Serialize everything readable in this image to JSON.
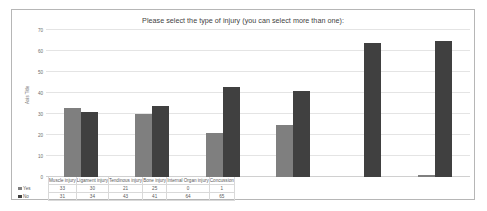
{
  "chart_data": {
    "type": "bar",
    "title": "Please select the type of injury (you can select more than one):",
    "xlabel": "",
    "ylabel": "Axis Title",
    "ylim": [
      0,
      70
    ],
    "ytick_step": 10,
    "yticks": [
      "0",
      "10",
      "20",
      "30",
      "40",
      "50",
      "60",
      "70"
    ],
    "grid": true,
    "legend_position": "data-table-left",
    "categories": [
      "Muscle injury",
      "Ligament injury",
      "Tendinous injury",
      "Bone injury",
      "Internal Organ injury",
      "Concussion"
    ],
    "series": [
      {
        "name": "Yes",
        "color": "#7f7f7f",
        "values": [
          33,
          30,
          21,
          25,
          0,
          1
        ]
      },
      {
        "name": "No",
        "color": "#404040",
        "values": [
          31,
          34,
          43,
          41,
          64,
          65
        ]
      }
    ]
  },
  "table": {
    "row_labels": [
      "Yes",
      "No"
    ],
    "rows": [
      [
        "33",
        "30",
        "21",
        "25",
        "0",
        "1"
      ],
      [
        "31",
        "34",
        "43",
        "41",
        "64",
        "65"
      ]
    ]
  },
  "colors": {
    "series_yes": "#7f7f7f",
    "series_no": "#404040",
    "frame_border": "#b6b6b6",
    "gridline": "#e4e4e4",
    "text": "#595959"
  }
}
